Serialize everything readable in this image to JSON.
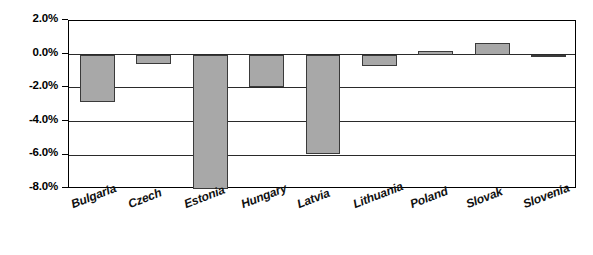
{
  "chart_data": {
    "type": "bar",
    "title": "",
    "xlabel": "",
    "ylabel": "",
    "categories": [
      "Bulgaria",
      "Czech",
      "Estonia",
      "Hungary",
      "Latvia",
      "Lithuania",
      "Poland",
      "Slovak",
      "Slovenia"
    ],
    "values": [
      -2.85,
      -0.55,
      -8.0,
      -1.9,
      -5.9,
      -0.7,
      0.2,
      0.7,
      -0.05
    ],
    "ylim": [
      -8.0,
      2.0
    ],
    "ytick_labels": [
      "2.0%",
      "0.0%",
      "-2.0%",
      "-4.0%",
      "-6.0%",
      "-8.0%"
    ],
    "ytick_values": [
      2.0,
      0.0,
      -2.0,
      -4.0,
      -6.0,
      -8.0
    ],
    "grid": true,
    "legend": false,
    "legend_position": "none",
    "bar_fill_color": "#a8a8a8",
    "bar_border_color": "#3a3a3a",
    "axis_color": "#000000",
    "background_color": "#ffffff"
  }
}
